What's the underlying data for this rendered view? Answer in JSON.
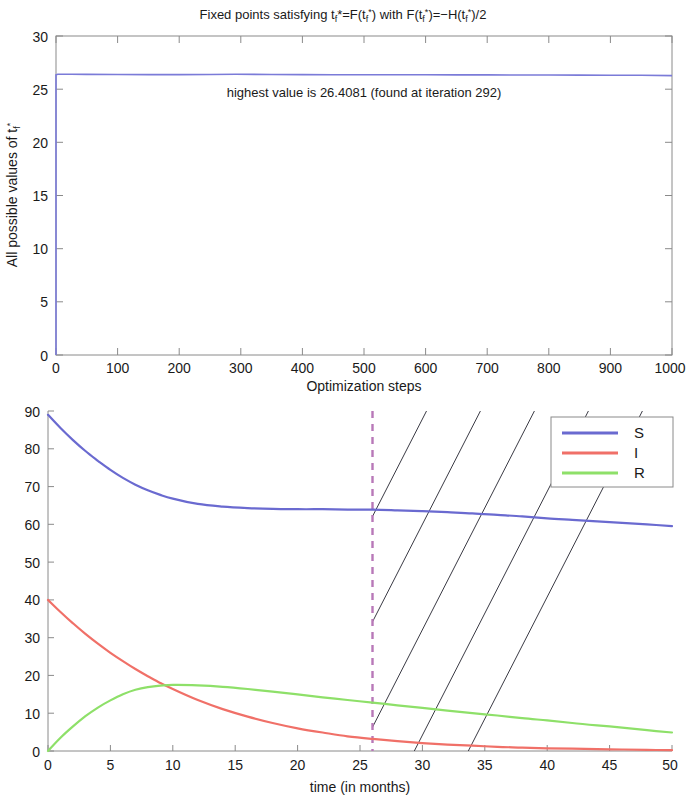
{
  "figure_top": {
    "title": "Fixed points satisfying t_f*=F(t_f*) with F(t_f*)=-H(t_f*)/2",
    "title_parts": {
      "p1": "Fixed points satisfying t",
      "sub1": "f",
      "p2": "*=F(t",
      "sub2": "f",
      "sup2": "*",
      "p3": ") with F(t",
      "sub3": "f",
      "sup3": "*",
      "p4": ")=−H(t",
      "sub4": "f",
      "sup4": "*",
      "p5": ")/2"
    },
    "ylabel_parts": {
      "p1": "All possible values of t",
      "sub": "f",
      "sup": "*"
    },
    "xlabel": "Optimization steps",
    "annotation": "highest value is 26.4081 (found at iteration 292)",
    "annotation_value": 26.4081,
    "annotation_iteration": 292,
    "xticks": [
      "0",
      "100",
      "200",
      "300",
      "400",
      "500",
      "600",
      "700",
      "800",
      "900",
      "1000"
    ],
    "yticks": [
      "0",
      "5",
      "10",
      "15",
      "20",
      "25",
      "30"
    ]
  },
  "figure_bottom": {
    "xlabel": "time (in months)",
    "xticks": [
      "0",
      "5",
      "10",
      "15",
      "20",
      "25",
      "30",
      "35",
      "40",
      "45",
      "50"
    ],
    "yticks": [
      "0",
      "10",
      "20",
      "30",
      "40",
      "50",
      "60",
      "70",
      "80",
      "90"
    ],
    "legend": [
      {
        "label": "S",
        "color": "#6a6ad0"
      },
      {
        "label": "I",
        "color": "#f07068"
      },
      {
        "label": "R",
        "color": "#8ee069"
      }
    ],
    "vline_label": "26",
    "vline_color": "#b878b8"
  },
  "colors": {
    "S": "#6a6ad0",
    "I": "#f07068",
    "R": "#8ee069",
    "fixed_point_line": "#7b7bd8",
    "axis": "#8a8a8a",
    "hatch": "#3a3a44",
    "vline": "#b878b8"
  },
  "chart_data": [
    {
      "type": "line",
      "id": "fixed-points-optimization",
      "title": "Fixed points satisfying t_f*=F(t_f*) with F(t_f*)=-H(t_f*)/2",
      "xlabel": "Optimization steps",
      "ylabel": "All possible values of t_f*",
      "xlim": [
        0,
        1000
      ],
      "ylim": [
        0,
        30
      ],
      "xticks": [
        0,
        100,
        200,
        300,
        400,
        500,
        600,
        700,
        800,
        900,
        1000
      ],
      "yticks": [
        0,
        5,
        10,
        15,
        20,
        25,
        30
      ],
      "grid": false,
      "legend": "none",
      "annotations": [
        {
          "text": "highest value is 26.4081 (found at iteration 292)",
          "x": 500,
          "y": 24.3
        }
      ],
      "series": [
        {
          "name": "t_f* fixed point value",
          "color": "#7b7bd8",
          "x": [
            0,
            0,
            3,
            10,
            25,
            50,
            100,
            150,
            200,
            250,
            292,
            350,
            400,
            450,
            500,
            550,
            600,
            650,
            700,
            750,
            800,
            850,
            900,
            950,
            1000
          ],
          "y": [
            0,
            26.35,
            26.4,
            26.4081,
            26.4,
            26.39,
            26.38,
            26.37,
            26.37,
            26.38,
            26.4081,
            26.38,
            26.37,
            26.36,
            26.36,
            26.35,
            26.35,
            26.34,
            26.34,
            26.33,
            26.33,
            26.32,
            26.31,
            26.3,
            26.28
          ]
        }
      ]
    },
    {
      "type": "line",
      "id": "sir-epidemic-curves",
      "title": "",
      "xlabel": "time (in months)",
      "ylabel": "",
      "xlim": [
        0,
        50
      ],
      "ylim": [
        0,
        90
      ],
      "xticks": [
        0,
        5,
        10,
        15,
        20,
        25,
        30,
        35,
        40,
        45,
        50
      ],
      "yticks": [
        0,
        10,
        20,
        30,
        40,
        50,
        60,
        70,
        80,
        90
      ],
      "grid": false,
      "legend": "upper right",
      "vertical_marker": {
        "x": 26,
        "style": "dashed",
        "color": "#b878b8"
      },
      "hatched_region": {
        "from_x": 26,
        "to_x": 50,
        "angle_deg": 45,
        "color": "#3a3a44",
        "lines": 6
      },
      "series": [
        {
          "name": "S",
          "color": "#6a6ad0",
          "x": [
            0,
            1,
            2,
            3,
            4,
            5,
            6,
            7,
            8,
            9,
            10,
            12,
            14,
            16,
            18,
            20,
            22,
            24,
            26,
            28,
            30,
            32,
            34,
            36,
            38,
            40,
            42,
            44,
            46,
            48,
            50
          ],
          "y": [
            89.0,
            85.5,
            82.3,
            79.4,
            76.8,
            74.4,
            72.3,
            70.5,
            69.0,
            67.8,
            66.8,
            65.4,
            64.7,
            64.3,
            64.1,
            64.0,
            64.0,
            63.9,
            63.9,
            63.7,
            63.5,
            63.2,
            62.9,
            62.5,
            62.1,
            61.6,
            61.2,
            60.8,
            60.4,
            60.0,
            59.5
          ]
        },
        {
          "name": "I",
          "color": "#f07068",
          "x": [
            0,
            1,
            2,
            3,
            4,
            5,
            6,
            7,
            8,
            9,
            10,
            12,
            14,
            16,
            18,
            20,
            22,
            24,
            26,
            28,
            30,
            32,
            34,
            36,
            38,
            40,
            42,
            44,
            46,
            48,
            50
          ],
          "y": [
            40.0,
            36.8,
            33.8,
            31.0,
            28.4,
            26.0,
            23.8,
            21.7,
            19.8,
            18.0,
            16.4,
            13.5,
            11.1,
            9.1,
            7.4,
            6.0,
            4.9,
            3.9,
            3.2,
            2.6,
            2.1,
            1.7,
            1.4,
            1.1,
            0.9,
            0.7,
            0.6,
            0.5,
            0.4,
            0.3,
            0.2
          ]
        },
        {
          "name": "R",
          "color": "#8ee069",
          "x": [
            0,
            1,
            2,
            3,
            4,
            5,
            6,
            7,
            8,
            9,
            10,
            12,
            14,
            16,
            18,
            20,
            22,
            24,
            26,
            28,
            30,
            32,
            34,
            36,
            38,
            40,
            42,
            44,
            46,
            48,
            50
          ],
          "y": [
            0.0,
            3.5,
            6.5,
            9.2,
            11.5,
            13.4,
            15.0,
            16.2,
            16.9,
            17.3,
            17.5,
            17.4,
            17.0,
            16.4,
            15.7,
            15.0,
            14.2,
            13.5,
            12.8,
            12.1,
            11.4,
            10.7,
            10.0,
            9.4,
            8.7,
            8.1,
            7.4,
            6.8,
            6.2,
            5.5,
            4.9
          ]
        }
      ]
    }
  ]
}
